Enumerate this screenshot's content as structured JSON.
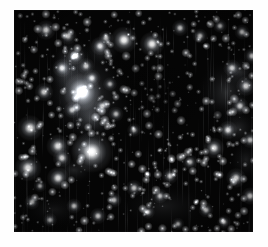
{
  "figure": {
    "kind": "astronomical-sky-image",
    "title": "",
    "caption": "",
    "canvas": {
      "width": 268,
      "height": 247
    },
    "panel": {
      "x": 14,
      "y": 10,
      "width": 239,
      "height": 222
    },
    "page_background": "#ffffff",
    "sky_background": "#050505",
    "star_color": "#ffffff",
    "nebula_color": "#9aa0a8",
    "has_axes": false,
    "has_labels": false,
    "has_colorbar": false,
    "artifacts": {
      "vertical_streaks": true,
      "streak_color": "#d8dce2",
      "streak_count": 150
    }
  },
  "chart_data": {
    "type": "scatter",
    "title": "",
    "xlabel": "",
    "ylabel": "",
    "xlim": [
      0,
      239
    ],
    "ylim": [
      0,
      222
    ],
    "grid": false,
    "legend": "none",
    "note": "Point sources (stars) in panel pixel coords; r = apparent radius, b = relative brightness 0-1",
    "nebulae": [
      {
        "x": 72,
        "y": 84,
        "rx": 46,
        "ry": 54,
        "b": 0.3,
        "rot": -18
      },
      {
        "x": 66,
        "y": 82,
        "rx": 26,
        "ry": 40,
        "b": 0.34,
        "rot": -22
      },
      {
        "x": 58,
        "y": 48,
        "rx": 20,
        "ry": 22,
        "b": 0.3,
        "rot": 0
      },
      {
        "x": 88,
        "y": 40,
        "rx": 18,
        "ry": 16,
        "b": 0.26,
        "rot": 0
      },
      {
        "x": 50,
        "y": 62,
        "rx": 16,
        "ry": 18,
        "b": 0.24,
        "rot": 0
      },
      {
        "x": 78,
        "y": 108,
        "rx": 24,
        "ry": 22,
        "b": 0.28,
        "rot": 0
      },
      {
        "x": 70,
        "y": 138,
        "rx": 18,
        "ry": 16,
        "b": 0.26,
        "rot": 0
      },
      {
        "x": 60,
        "y": 160,
        "rx": 22,
        "ry": 14,
        "b": 0.18,
        "rot": 0
      },
      {
        "x": 212,
        "y": 82,
        "rx": 30,
        "ry": 34,
        "b": 0.22,
        "rot": 10
      },
      {
        "x": 226,
        "y": 62,
        "rx": 18,
        "ry": 16,
        "b": 0.22,
        "rot": 0
      },
      {
        "x": 224,
        "y": 118,
        "rx": 22,
        "ry": 20,
        "b": 0.2,
        "rot": 0
      },
      {
        "x": 232,
        "y": 150,
        "rx": 16,
        "ry": 20,
        "b": 0.16,
        "rot": 0
      },
      {
        "x": 150,
        "y": 196,
        "rx": 46,
        "ry": 22,
        "b": 0.12,
        "rot": 0
      },
      {
        "x": 40,
        "y": 200,
        "rx": 34,
        "ry": 18,
        "b": 0.1,
        "rot": 0
      }
    ],
    "dark_patches": [
      {
        "x": 150,
        "y": 88,
        "rx": 46,
        "ry": 40,
        "b": 0.55
      },
      {
        "x": 204,
        "y": 104,
        "rx": 14,
        "ry": 12,
        "b": 0.6
      },
      {
        "x": 120,
        "y": 60,
        "rx": 30,
        "ry": 26,
        "b": 0.35
      }
    ],
    "stars": [
      {
        "x": 68,
        "y": 82,
        "r": 6.4,
        "b": 1.0
      },
      {
        "x": 78,
        "y": 142,
        "r": 7.0,
        "b": 0.98
      },
      {
        "x": 110,
        "y": 30,
        "r": 4.6,
        "b": 0.95
      },
      {
        "x": 138,
        "y": 34,
        "r": 4.2,
        "b": 0.92
      },
      {
        "x": 16,
        "y": 118,
        "r": 4.4,
        "b": 0.9
      },
      {
        "x": 14,
        "y": 158,
        "r": 4.6,
        "b": 0.92
      },
      {
        "x": 44,
        "y": 136,
        "r": 4.0,
        "b": 0.88
      },
      {
        "x": 48,
        "y": 148,
        "r": 3.2,
        "b": 0.8
      },
      {
        "x": 44,
        "y": 168,
        "r": 3.8,
        "b": 0.86
      },
      {
        "x": 30,
        "y": 82,
        "r": 3.2,
        "b": 0.78
      },
      {
        "x": 32,
        "y": 20,
        "r": 3.4,
        "b": 0.82
      },
      {
        "x": 54,
        "y": 26,
        "r": 3.0,
        "b": 0.76
      },
      {
        "x": 48,
        "y": 58,
        "r": 3.2,
        "b": 0.8
      },
      {
        "x": 62,
        "y": 46,
        "r": 3.0,
        "b": 0.78
      },
      {
        "x": 72,
        "y": 56,
        "r": 2.8,
        "b": 0.74
      },
      {
        "x": 86,
        "y": 36,
        "r": 3.2,
        "b": 0.8
      },
      {
        "x": 92,
        "y": 28,
        "r": 2.6,
        "b": 0.7
      },
      {
        "x": 78,
        "y": 68,
        "r": 3.0,
        "b": 0.78
      },
      {
        "x": 58,
        "y": 100,
        "r": 2.8,
        "b": 0.72
      },
      {
        "x": 88,
        "y": 96,
        "r": 2.6,
        "b": 0.7
      },
      {
        "x": 96,
        "y": 74,
        "r": 2.4,
        "b": 0.66
      },
      {
        "x": 102,
        "y": 104,
        "r": 2.6,
        "b": 0.7
      },
      {
        "x": 120,
        "y": 120,
        "r": 2.4,
        "b": 0.66
      },
      {
        "x": 166,
        "y": 18,
        "r": 2.8,
        "b": 0.74
      },
      {
        "x": 186,
        "y": 26,
        "r": 2.6,
        "b": 0.7
      },
      {
        "x": 206,
        "y": 16,
        "r": 2.4,
        "b": 0.66
      },
      {
        "x": 228,
        "y": 22,
        "r": 2.6,
        "b": 0.72
      },
      {
        "x": 238,
        "y": 46,
        "r": 2.8,
        "b": 0.76
      },
      {
        "x": 218,
        "y": 58,
        "r": 3.0,
        "b": 0.8
      },
      {
        "x": 232,
        "y": 76,
        "r": 3.4,
        "b": 0.84
      },
      {
        "x": 226,
        "y": 96,
        "r": 3.0,
        "b": 0.8
      },
      {
        "x": 214,
        "y": 120,
        "r": 3.2,
        "b": 0.82
      },
      {
        "x": 236,
        "y": 130,
        "r": 2.8,
        "b": 0.76
      },
      {
        "x": 200,
        "y": 138,
        "r": 3.6,
        "b": 0.86
      },
      {
        "x": 222,
        "y": 168,
        "r": 3.4,
        "b": 0.84
      },
      {
        "x": 236,
        "y": 186,
        "r": 3.0,
        "b": 0.78
      },
      {
        "x": 176,
        "y": 152,
        "r": 2.6,
        "b": 0.7
      },
      {
        "x": 156,
        "y": 166,
        "r": 2.8,
        "b": 0.74
      },
      {
        "x": 146,
        "y": 186,
        "r": 2.6,
        "b": 0.7
      },
      {
        "x": 120,
        "y": 178,
        "r": 2.8,
        "b": 0.74
      },
      {
        "x": 100,
        "y": 190,
        "r": 2.6,
        "b": 0.7
      },
      {
        "x": 84,
        "y": 206,
        "r": 2.8,
        "b": 0.74
      },
      {
        "x": 60,
        "y": 196,
        "r": 2.6,
        "b": 0.7
      },
      {
        "x": 36,
        "y": 210,
        "r": 2.4,
        "b": 0.66
      },
      {
        "x": 18,
        "y": 192,
        "r": 2.6,
        "b": 0.7
      },
      {
        "x": 26,
        "y": 176,
        "r": 2.2,
        "b": 0.62
      },
      {
        "x": 134,
        "y": 202,
        "r": 2.4,
        "b": 0.66
      },
      {
        "x": 192,
        "y": 200,
        "r": 2.6,
        "b": 0.7
      },
      {
        "x": 210,
        "y": 212,
        "r": 2.4,
        "b": 0.64
      },
      {
        "x": 164,
        "y": 214,
        "r": 2.2,
        "b": 0.62
      }
    ],
    "faint_star_count": 620,
    "seed": 20240917
  }
}
